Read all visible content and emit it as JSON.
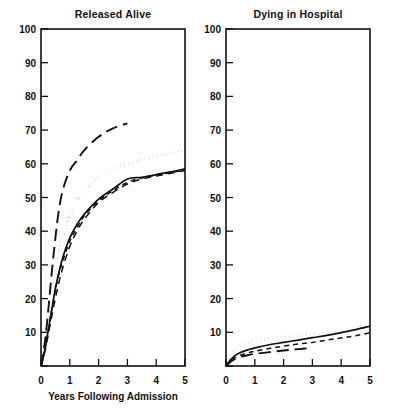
{
  "figure": {
    "background_color": "#ffffff",
    "ink_color": "#111111"
  },
  "chart_data": [
    {
      "type": "line",
      "title": "Released Alive",
      "xlabel": "Years Following Admission",
      "ylabel": "",
      "xlim": [
        0,
        5
      ],
      "ylim": [
        0,
        100
      ],
      "xticks": [
        0,
        1,
        2,
        3,
        4,
        5
      ],
      "xtick_labels": [
        "0",
        "1",
        "2",
        "3",
        "4",
        "5"
      ],
      "yticks": [
        0,
        10,
        20,
        30,
        40,
        50,
        60,
        70,
        80,
        90,
        100
      ],
      "ytick_labels": [
        "0",
        "10",
        "20",
        "30",
        "40",
        "50",
        "60",
        "70",
        "80",
        "90",
        "100"
      ],
      "grid": false,
      "legend": "none",
      "series": [
        {
          "name": "long-dash",
          "style": "long-dash",
          "x": [
            0,
            0.1,
            0.2,
            0.3,
            0.4,
            0.5,
            0.6,
            0.75,
            1.0,
            1.25,
            1.5,
            2.0,
            2.5,
            3.0
          ],
          "values": [
            0,
            5,
            12,
            21,
            30,
            38,
            45,
            52,
            58,
            61,
            64,
            68,
            70.5,
            72
          ]
        },
        {
          "name": "dotted",
          "style": "dotted",
          "x": [
            0,
            0.1,
            0.2,
            0.3,
            0.4,
            0.5,
            0.6,
            0.75,
            1.0,
            1.25,
            1.5,
            2.0,
            2.5,
            3.0,
            3.5,
            4.0,
            4.5,
            5.0
          ],
          "values": [
            0,
            4,
            9,
            15,
            21,
            27,
            32,
            38,
            45,
            49,
            52,
            56,
            58.5,
            60,
            61.3,
            62.3,
            63.2,
            64
          ]
        },
        {
          "name": "solid",
          "style": "solid",
          "x": [
            0,
            0.1,
            0.2,
            0.3,
            0.4,
            0.5,
            0.6,
            0.75,
            1.0,
            1.25,
            1.5,
            2.0,
            2.5,
            3.0,
            3.5,
            4.0,
            4.5,
            5.0
          ],
          "values": [
            0,
            3.5,
            8,
            13,
            18,
            23,
            27,
            32,
            38,
            42,
            45,
            49.5,
            52.5,
            55.5,
            56,
            56.8,
            57.6,
            58.5
          ]
        },
        {
          "name": "short-dash",
          "style": "short-dash",
          "x": [
            0,
            0.1,
            0.2,
            0.3,
            0.4,
            0.5,
            0.6,
            0.75,
            1.0,
            1.25,
            1.5,
            2.0,
            2.5,
            3.0,
            3.5,
            4.0,
            4.5,
            5.0
          ],
          "values": [
            0,
            3.5,
            8,
            13,
            18,
            22.5,
            26.5,
            31,
            37,
            41,
            44.5,
            49,
            52,
            54.5,
            55.8,
            56.6,
            57.4,
            58.2
          ]
        },
        {
          "name": "dashed-lower-early",
          "style": "medium-dash",
          "x": [
            0,
            0.1,
            0.2,
            0.3,
            0.4,
            0.5,
            0.6,
            0.75,
            1.0,
            1.25,
            1.5,
            2.0,
            2.5,
            3.0,
            3.5,
            4.0,
            4.5,
            5.0
          ],
          "values": [
            0,
            3,
            7,
            11.5,
            16,
            20,
            24,
            29,
            35.5,
            40,
            43.5,
            48.5,
            51.5,
            54,
            55.5,
            56.4,
            57.2,
            58
          ]
        }
      ]
    },
    {
      "type": "line",
      "title": "Dying in Hospital",
      "xlabel": "",
      "ylabel": "",
      "xlim": [
        0,
        5
      ],
      "ylim": [
        0,
        100
      ],
      "xticks": [
        0,
        1,
        2,
        3,
        4,
        5
      ],
      "xtick_labels": [
        "0",
        "1",
        "2",
        "3",
        "4",
        "5"
      ],
      "yticks": [
        0,
        10,
        20,
        30,
        40,
        50,
        60,
        70,
        80,
        90,
        100
      ],
      "ytick_labels": [
        "0",
        "10",
        "20",
        "30",
        "40",
        "50",
        "60",
        "70",
        "80",
        "90",
        "100"
      ],
      "grid": false,
      "legend": "none",
      "series": [
        {
          "name": "dotted",
          "style": "dotted",
          "x": [
            0,
            0.1,
            0.2,
            0.3,
            0.5,
            0.75,
            1.0,
            1.5,
            2.0,
            2.5,
            3.0,
            3.5,
            4.0,
            4.5,
            5.0
          ],
          "values": [
            0,
            1.8,
            3.4,
            4.6,
            6.0,
            6.9,
            7.5,
            8.1,
            8.6,
            9.0,
            9.4,
            9.9,
            10.4,
            11.1,
            12.0
          ]
        },
        {
          "name": "solid",
          "style": "solid",
          "x": [
            0,
            0.1,
            0.2,
            0.3,
            0.5,
            0.75,
            1.0,
            1.5,
            2.0,
            2.5,
            3.0,
            3.5,
            4.0,
            4.5,
            5.0
          ],
          "values": [
            0,
            1.2,
            2.2,
            3.0,
            4.0,
            4.8,
            5.4,
            6.3,
            7.0,
            7.7,
            8.4,
            9.1,
            9.9,
            10.8,
            11.8
          ]
        },
        {
          "name": "short-dash",
          "style": "short-dash",
          "x": [
            0,
            0.1,
            0.2,
            0.3,
            0.5,
            0.75,
            1.0,
            1.5,
            2.0,
            2.5,
            3.0,
            3.5,
            4.0,
            4.5,
            5.0
          ],
          "values": [
            0,
            1.0,
            1.8,
            2.4,
            3.2,
            3.9,
            4.4,
            5.2,
            5.9,
            6.5,
            7.0,
            7.7,
            8.3,
            9.0,
            9.8
          ]
        },
        {
          "name": "long-dash",
          "style": "long-dash",
          "x": [
            0,
            0.1,
            0.2,
            0.3,
            0.5,
            0.75,
            1.0,
            1.5,
            2.0,
            2.5,
            3.0
          ],
          "values": [
            0,
            0.8,
            1.5,
            2.0,
            2.7,
            3.2,
            3.6,
            4.1,
            4.6,
            5.0,
            5.4
          ]
        }
      ]
    }
  ]
}
